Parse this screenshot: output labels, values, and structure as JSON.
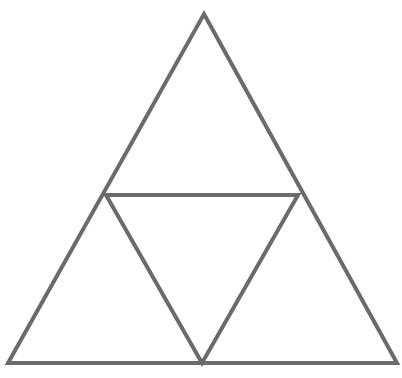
{
  "diagram": {
    "stroke_color": "#6b6b6b",
    "stroke_width": 4,
    "background": "#ffffff",
    "outer_triangle": {
      "apex": [
        204,
        14
      ],
      "bottom_left": [
        8,
        363
      ],
      "bottom_right": [
        397,
        363
      ]
    },
    "inner_triangle": {
      "left": [
        106,
        195
      ],
      "right": [
        298,
        195
      ],
      "bottom": [
        202,
        363
      ]
    }
  }
}
